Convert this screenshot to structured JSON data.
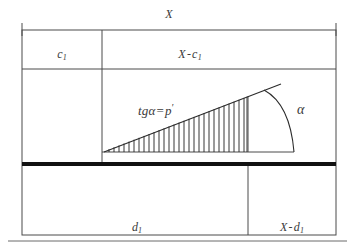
{
  "figure": {
    "type": "geometric-diagram",
    "labels": {
      "total_width": "X",
      "left_segment_top": "c",
      "left_segment_top_sub": "1",
      "right_segment_top_minuend": "X",
      "right_segment_top_operator": "-",
      "right_segment_top_subtrahend": "c",
      "right_segment_top_sub": "1",
      "formula_lhs": "tg",
      "formula_alpha": "α",
      "formula_eq": "=",
      "formula_rhs": "p",
      "formula_prime": "′",
      "angle": "α",
      "bottom_left_segment": "d",
      "bottom_left_segment_sub": "1",
      "bottom_right_minuend": "X",
      "bottom_right_operator": "-",
      "bottom_right_subtrahend": "d",
      "bottom_right_sub": "1"
    },
    "colors": {
      "stroke": "#4a4a4a",
      "heavy_bar": "#111111",
      "text": "#3a3a3a",
      "background": "#ffffff"
    },
    "geometry": {
      "frame_left": 22,
      "frame_right": 336,
      "frame_top": 30,
      "frame_bottom": 235,
      "row_divider_c1": 69,
      "heavy_bar_y": 164,
      "vertical_divider_top": 102,
      "vertical_divider_bottom": 248,
      "triangle_apex_x": 104,
      "triangle_baseline_y": 152,
      "triangle_right_x": 248,
      "triangle_top_y": 95,
      "slope_line_end_x": 281,
      "arc_baseline_x": 294,
      "hatch_count": 29,
      "hatch_spacing": 5
    }
  }
}
